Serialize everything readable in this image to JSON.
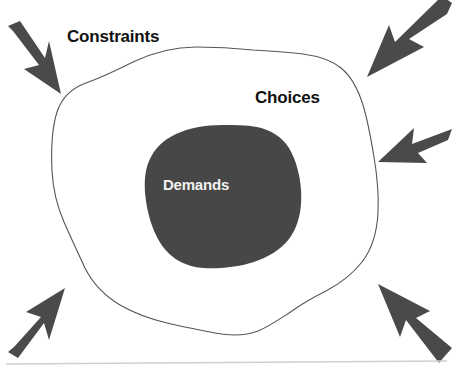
{
  "figure": {
    "title_text": "",
    "type": "concept-diagram",
    "background_color": "#ffffff",
    "width": 453,
    "height": 372,
    "labels": {
      "outer_region": "Constraints",
      "middle_region": "Choices",
      "inner_region": "Demands"
    },
    "colors": {
      "inner_blob_fill": "#474747",
      "inner_blob_label": "#f2f2f2",
      "outer_blob_fill": "#ffffff",
      "outer_blob_stroke": "#555555",
      "arrow_fill": "#4a4a4a",
      "text": "#111111",
      "baseline_rule": "#cfcfcf"
    },
    "arrows": [
      {
        "name": "arrow-top-left",
        "direction": "down-right",
        "points_toward": "center"
      },
      {
        "name": "arrow-top-right",
        "direction": "down-left",
        "points_toward": "center"
      },
      {
        "name": "arrow-right",
        "direction": "left",
        "points_toward": "center"
      },
      {
        "name": "arrow-bottom-left",
        "direction": "up-right",
        "points_toward": "center"
      },
      {
        "name": "arrow-bottom-right",
        "direction": "up-left",
        "points_toward": "center"
      }
    ],
    "arrow_count": 5
  }
}
